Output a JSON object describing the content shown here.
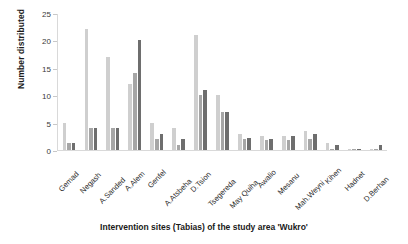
{
  "chart_data": {
    "type": "bar",
    "title": "",
    "xlabel": "Intervention sites (Tabias) of the study area 'Wukro'",
    "ylabel": "Number distributed",
    "ylim": [
      0,
      25
    ],
    "yticks": [
      0,
      5,
      10,
      15,
      20,
      25
    ],
    "grid": false,
    "legend": "none",
    "categories": [
      "Gemad",
      "Negash",
      "A.Sanded",
      "A.Alem",
      "Genfel",
      "A.Atsbeha",
      "D.Tsion",
      "Tsegereda",
      "May Quiha",
      "Awalio",
      "Mesanu",
      "Mah.Weyni",
      "Kihen",
      "Hadnet",
      "D.Berhan"
    ],
    "series": [
      {
        "name": "Series 1",
        "color": "#cfcfcf",
        "values": [
          5,
          22,
          17,
          12,
          5,
          4,
          21,
          10,
          3,
          2.5,
          2.5,
          3.5,
          1.2,
          0.2,
          0.2
        ]
      },
      {
        "name": "Series 2",
        "color": "#a6a6a6",
        "values": [
          1.2,
          4,
          4,
          14,
          2,
          1,
          10,
          7,
          2,
          1.8,
          1.8,
          2,
          0.2,
          0.2,
          0.2
        ]
      },
      {
        "name": "Series 3",
        "color": "#6e6e6e",
        "values": [
          1.2,
          4,
          4,
          20,
          3,
          2,
          11,
          7,
          2.2,
          2,
          2.5,
          3,
          1,
          0.2,
          1
        ]
      }
    ]
  }
}
